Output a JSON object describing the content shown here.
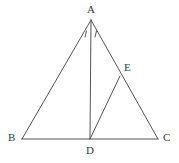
{
  "figure": {
    "type": "geometry-diagram",
    "stroke_color": "#555555",
    "label_color": "#3b3b3b",
    "background_color": "#ffffff",
    "stroke_width": 1,
    "points": [
      {
        "name": "A",
        "label": "A",
        "x": 91,
        "y": 20,
        "label_x": 87,
        "label_y": 4
      },
      {
        "name": "B",
        "label": "B",
        "x": 22,
        "y": 139,
        "label_x": 8,
        "label_y": 132
      },
      {
        "name": "C",
        "label": "C",
        "x": 158,
        "y": 139,
        "label_x": 163,
        "label_y": 132
      },
      {
        "name": "D",
        "label": "D",
        "x": 90,
        "y": 139,
        "label_x": 86,
        "label_y": 145
      },
      {
        "name": "E",
        "label": "E",
        "x": 120,
        "y": 76,
        "label_x": 124,
        "label_y": 62
      }
    ],
    "segments": [
      {
        "name": "AB",
        "from": "A",
        "to": "B"
      },
      {
        "name": "AC",
        "from": "A",
        "to": "C"
      },
      {
        "name": "BC",
        "from": "B",
        "to": "C"
      },
      {
        "name": "AD",
        "from": "A",
        "to": "D"
      },
      {
        "name": "DE",
        "from": "D",
        "to": "E"
      }
    ],
    "angle_marks": [
      {
        "name": "angle-mark-left",
        "x1": 85,
        "y1": 37,
        "x2": 86.5,
        "y2": 31
      },
      {
        "name": "angle-mark-right",
        "x1": 95,
        "y1": 37,
        "x2": 96.5,
        "y2": 31
      }
    ]
  }
}
